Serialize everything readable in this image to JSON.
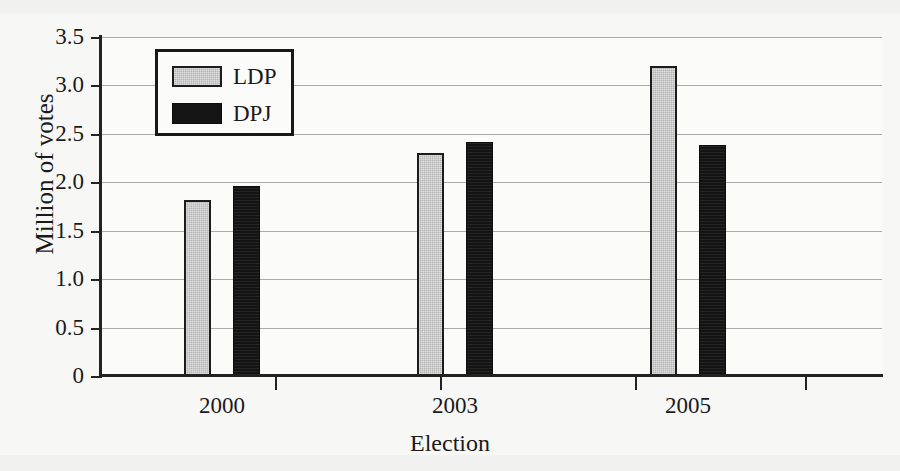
{
  "chart_data": {
    "type": "bar",
    "title": "",
    "xlabel": "Election",
    "ylabel": "Million of votes",
    "categories": [
      "2000",
      "2003",
      "2005"
    ],
    "series": [
      {
        "name": "LDP",
        "color": "#b4b4b4",
        "values": [
          1.82,
          2.3,
          3.2
        ]
      },
      {
        "name": "DPJ",
        "color": "#141414",
        "values": [
          1.96,
          2.42,
          2.39
        ]
      }
    ],
    "ylim": [
      0,
      3.5
    ],
    "ytick_labels": [
      "0",
      "0.5",
      "1.0",
      "1.5",
      "2.0",
      "2.5",
      "3.0",
      "3.5"
    ],
    "ytick_values": [
      0,
      0.5,
      1.0,
      1.5,
      2.0,
      2.5,
      3.0,
      3.5
    ],
    "grid": true,
    "legend_position": "upper-left-inside"
  },
  "legend": {
    "entries": [
      {
        "label": "LDP"
      },
      {
        "label": "DPJ"
      }
    ]
  },
  "axes": {
    "y_title": "Million of votes",
    "x_title": "Election",
    "y_ticks": [
      "3.5",
      "3.0",
      "2.5",
      "2.0",
      "1.5",
      "1.0",
      "0.5",
      "0"
    ],
    "x_ticks": [
      "2000",
      "2003",
      "2005"
    ]
  }
}
